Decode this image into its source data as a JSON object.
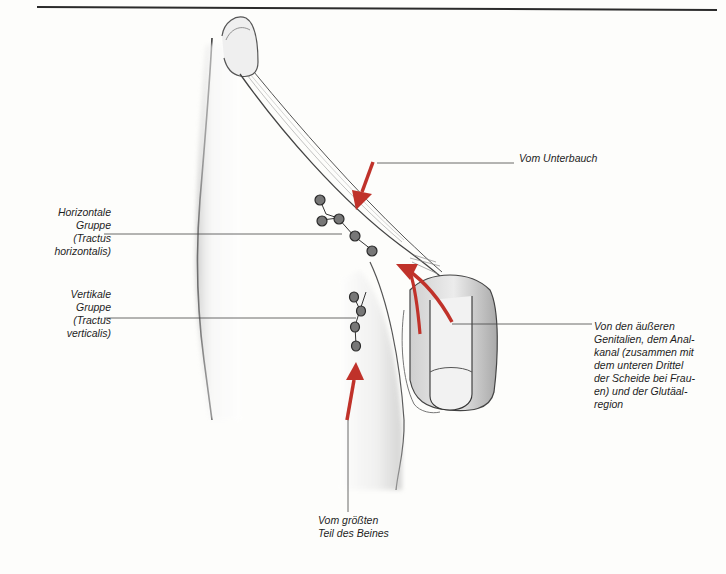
{
  "figure": {
    "colors": {
      "arrow": "#c0322a",
      "line": "#444444",
      "node": "#555555",
      "skin_shade": "#b8b8b8",
      "background": "#fdfdfb"
    },
    "labels": {
      "horizontal_group": "Horizontale\nGruppe\n(Tractus\nhorizontalis)",
      "vertical_group": "Vertikale\nGruppe\n(Tractus\nverticalis)",
      "from_lower_abdomen": "Vom Unterbauch",
      "from_genitals": "Von den äußeren\nGenitalien, dem Anal-\nkanal (zusammen mit\ndem unteren Drittel\nder Scheide bei Frau-\nen) und der Glutäal-\nregion",
      "from_leg": "Vom größten\nTeil des Beines"
    },
    "arrows": [
      {
        "name": "arrow-from-lower-abdomen",
        "direction": "down-left"
      },
      {
        "name": "arrow-from-genitals",
        "direction": "up-left curved"
      },
      {
        "name": "arrow-from-leg",
        "direction": "up"
      }
    ],
    "node_groups": [
      {
        "name": "horizontal",
        "count": 5
      },
      {
        "name": "vertical",
        "count": 4
      }
    ]
  }
}
